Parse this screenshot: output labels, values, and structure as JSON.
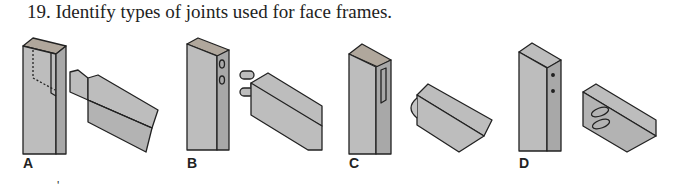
{
  "question": {
    "number": "19.",
    "text": "19. Identify types of joints used for face frames."
  },
  "figures": [
    {
      "label": "A",
      "joint": "tongue-and-groove / stub tenon"
    },
    {
      "label": "B",
      "joint": "dowel joint"
    },
    {
      "label": "C",
      "joint": "biscuit / spline groove"
    },
    {
      "label": "D",
      "joint": "pocket screw"
    }
  ],
  "colors": {
    "wood_face": "#bdbdbd",
    "wood_side": "#a9a9a9",
    "outline": "#222222"
  },
  "footer_mark": "'"
}
